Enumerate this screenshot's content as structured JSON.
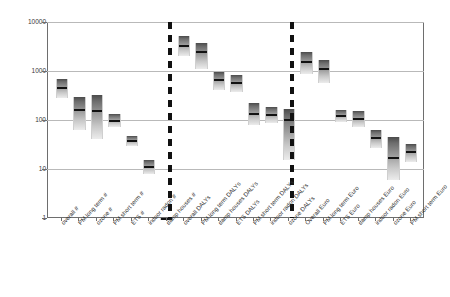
{
  "chart_data": {
    "type": "bar",
    "title": "",
    "xlabel": "",
    "ylabel": "",
    "ylim": [
      1,
      10000
    ],
    "yscale": "log",
    "grid": true,
    "legend": null,
    "ytick_labels": [
      "1",
      "10",
      "100",
      "1000",
      "10000"
    ],
    "ytick_values": [
      1,
      10,
      100,
      1000,
      10000
    ],
    "group_separators": 2,
    "groups": [
      {
        "name": "number",
        "categories": [
          "overall #",
          "PM long term #",
          "ozone #",
          "PM short term #",
          "ETS #",
          "indoor radon #",
          "damp houses #"
        ],
        "median": [
          440,
          160,
          150,
          95,
          38,
          11,
          1
        ],
        "low": [
          280,
          62,
          40,
          72,
          30,
          8,
          1
        ],
        "high": [
          700,
          300,
          330,
          130,
          48,
          15,
          1
        ]
      },
      {
        "name": "DALYs",
        "categories": [
          "overall DALYs",
          "PM long term DALYs",
          "damp houses DALYs",
          "ETS DALYs",
          "PM short term DALYs",
          "indoor radon DALYs",
          "ozone DALYs"
        ],
        "median": [
          3300,
          2400,
          640,
          560,
          130,
          125,
          100
        ],
        "low": [
          2000,
          1100,
          400,
          380,
          80,
          88,
          15
        ],
        "high": [
          5200,
          3800,
          950,
          820,
          220,
          180,
          165
        ]
      },
      {
        "name": "Euro",
        "categories": [
          "Overall Euro",
          "PM long term Euro",
          "ETS Euro",
          "damp houses Euro",
          "indoor radon Euro",
          "ozone Euro",
          "PM short term Euro"
        ],
        "median": [
          1500,
          1100,
          120,
          105,
          42,
          17,
          22
        ],
        "low": [
          850,
          560,
          90,
          72,
          27,
          6,
          14
        ],
        "high": [
          2400,
          1700,
          160,
          150,
          62,
          46,
          33
        ]
      }
    ]
  }
}
